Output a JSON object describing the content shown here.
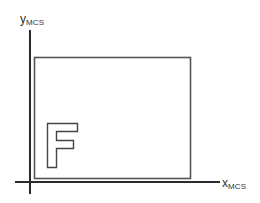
{
  "diagram": {
    "title": "",
    "axes": {
      "y": {
        "label_main": "y",
        "label_sub": "MCS"
      },
      "x": {
        "label_main": "x",
        "label_sub": "MCS"
      }
    },
    "letter": "F",
    "colors": {
      "axis": "#2b2b2b",
      "rect": "#555555",
      "letter_outline": "#444444",
      "label": "#333333"
    }
  }
}
